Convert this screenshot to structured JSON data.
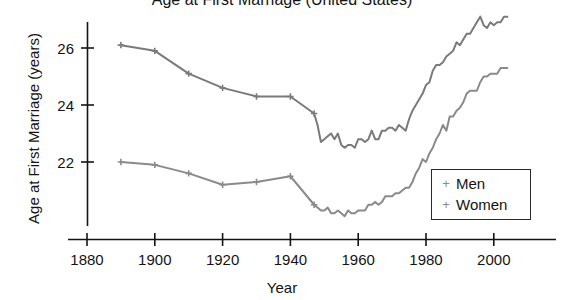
{
  "chart_data": {
    "type": "line",
    "title": "Age at First Marriage (United States)",
    "title_truncated": true,
    "xlabel": "Year",
    "ylabel": "Age at First Marriage (years)",
    "xlim": [
      1880,
      2010
    ],
    "ylim": [
      20.1,
      27.3
    ],
    "xticks": [
      1880,
      1900,
      1920,
      1940,
      1960,
      1980,
      2000
    ],
    "xtick_labels": [
      "1880",
      "1900",
      "1920",
      "1940",
      "1960",
      "1980",
      "2000"
    ],
    "yticks": [
      22,
      24,
      26
    ],
    "ytick_labels": [
      "22",
      "24",
      "26"
    ],
    "grid": false,
    "legend_position": "lower right",
    "marker": "+",
    "line_color": "#7a7a7a",
    "axis_color": "#141414",
    "series": [
      {
        "name": "Men",
        "color": "#7a7a7a",
        "x": [
          1890,
          1900,
          1910,
          1920,
          1930,
          1940,
          1947,
          1948,
          1949,
          1950,
          1951,
          1952,
          1953,
          1954,
          1955,
          1956,
          1957,
          1958,
          1959,
          1960,
          1961,
          1962,
          1963,
          1964,
          1965,
          1966,
          1967,
          1968,
          1969,
          1970,
          1971,
          1972,
          1973,
          1974,
          1975,
          1976,
          1977,
          1978,
          1979,
          1980,
          1981,
          1982,
          1983,
          1984,
          1985,
          1986,
          1987,
          1988,
          1989,
          1990,
          1991,
          1992,
          1993,
          1994,
          1995,
          1996,
          1997,
          1998,
          1999,
          2000,
          2001,
          2002,
          2003,
          2004
        ],
        "y": [
          26.1,
          25.9,
          25.1,
          24.6,
          24.3,
          24.3,
          23.7,
          23.3,
          22.7,
          22.8,
          22.9,
          23.0,
          22.8,
          23.0,
          22.6,
          22.5,
          22.6,
          22.6,
          22.5,
          22.8,
          22.8,
          22.7,
          22.8,
          23.1,
          22.8,
          22.8,
          23.1,
          23.1,
          23.2,
          23.2,
          23.1,
          23.3,
          23.2,
          23.1,
          23.5,
          23.8,
          24.0,
          24.2,
          24.4,
          24.7,
          24.8,
          25.2,
          25.4,
          25.4,
          25.5,
          25.7,
          25.8,
          25.9,
          26.2,
          26.1,
          26.3,
          26.5,
          26.5,
          26.7,
          26.9,
          27.1,
          26.8,
          26.7,
          26.9,
          26.8,
          26.9,
          26.9,
          27.1,
          27.1
        ]
      },
      {
        "name": "Women",
        "color": "#8a8a8a",
        "x": [
          1890,
          1900,
          1910,
          1920,
          1930,
          1940,
          1947,
          1948,
          1949,
          1950,
          1951,
          1952,
          1953,
          1954,
          1955,
          1956,
          1957,
          1958,
          1959,
          1960,
          1961,
          1962,
          1963,
          1964,
          1965,
          1966,
          1967,
          1968,
          1969,
          1970,
          1971,
          1972,
          1973,
          1974,
          1975,
          1976,
          1977,
          1978,
          1979,
          1980,
          1981,
          1982,
          1983,
          1984,
          1985,
          1986,
          1987,
          1988,
          1989,
          1990,
          1991,
          1992,
          1993,
          1994,
          1995,
          1996,
          1997,
          1998,
          1999,
          2000,
          2001,
          2002,
          2003,
          2004
        ],
        "y": [
          22.0,
          21.9,
          21.6,
          21.2,
          21.3,
          21.5,
          20.5,
          20.4,
          20.3,
          20.3,
          20.4,
          20.2,
          20.2,
          20.3,
          20.2,
          20.1,
          20.3,
          20.2,
          20.2,
          20.3,
          20.3,
          20.3,
          20.5,
          20.5,
          20.6,
          20.5,
          20.6,
          20.8,
          20.8,
          20.8,
          20.9,
          20.9,
          21.0,
          21.1,
          21.1,
          21.3,
          21.6,
          21.8,
          22.1,
          22.0,
          22.3,
          22.5,
          22.8,
          23.0,
          23.3,
          23.1,
          23.6,
          23.6,
          23.8,
          23.9,
          24.1,
          24.4,
          24.5,
          24.5,
          24.5,
          24.8,
          25.0,
          25.0,
          25.1,
          25.1,
          25.1,
          25.3,
          25.3,
          25.3
        ]
      }
    ]
  },
  "axes": {
    "xaxis_title": "Year",
    "yaxis_title": "Age at First Marriage (years)"
  },
  "title": {
    "text": "Age at First Marriage (United States)"
  },
  "legend": {
    "marker_glyph": "+",
    "entries": [
      {
        "label": "Men"
      },
      {
        "label": "Women"
      }
    ]
  }
}
